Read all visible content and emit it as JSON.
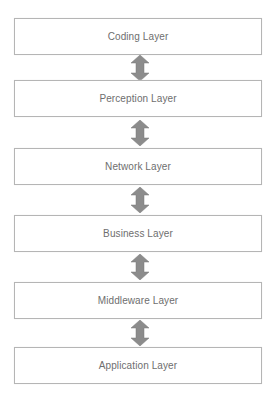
{
  "diagram": {
    "type": "layered-stack",
    "layers": [
      {
        "label": "Coding Layer"
      },
      {
        "label": "Perception Layer"
      },
      {
        "label": "Network Layer"
      },
      {
        "label": "Business Layer"
      },
      {
        "label": "Middleware Layer"
      },
      {
        "label": "Application Layer"
      }
    ],
    "connectors": [
      {
        "from": "Coding Layer",
        "to": "Perception Layer",
        "type": "bidirectional-arrow"
      },
      {
        "from": "Perception Layer",
        "to": "Network Layer",
        "type": "bidirectional-arrow"
      },
      {
        "from": "Network Layer",
        "to": "Business Layer",
        "type": "bidirectional-arrow"
      },
      {
        "from": "Business Layer",
        "to": "Middleware Layer",
        "type": "bidirectional-arrow"
      },
      {
        "from": "Middleware Layer",
        "to": "Application Layer",
        "type": "bidirectional-arrow"
      }
    ],
    "colors": {
      "box_border": "#b5b5b5",
      "text": "#6e6e6e",
      "arrow_fill": "#8c8c8c",
      "background": "#ffffff"
    }
  }
}
